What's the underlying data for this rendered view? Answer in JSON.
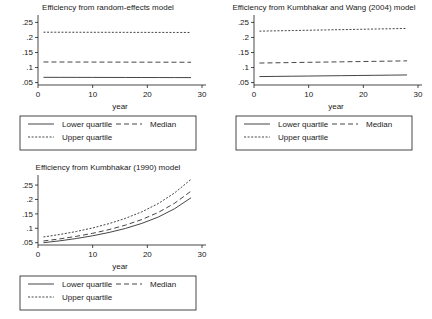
{
  "figure": {
    "background": "#ffffff",
    "line_color": "#303030",
    "axis_color": "#1a1a1a"
  },
  "legend": {
    "entries": [
      {
        "label": "Lower quartile",
        "style": "solid"
      },
      {
        "label": "Median",
        "style": "dashed"
      },
      {
        "label": "Upper quartile",
        "style": "dotted"
      }
    ]
  },
  "chart_data": [
    {
      "type": "line",
      "title": "Efficiency from random-effects model",
      "xlabel": "year",
      "ylabel": "",
      "xlim": [
        0,
        30
      ],
      "ylim": [
        0.042,
        0.268
      ],
      "xticks": [
        0,
        10,
        20,
        30
      ],
      "yticks": [
        0.05,
        0.1,
        0.15,
        0.2,
        0.25
      ],
      "ytick_labels": [
        ".05",
        ".1",
        ".15",
        ".2",
        ".25"
      ],
      "xtick_labels": [
        "0",
        "10",
        "20",
        "30"
      ],
      "grid": false,
      "legend_position": "below",
      "x": [
        1,
        4,
        7,
        10,
        13,
        16,
        19,
        22,
        25,
        28
      ],
      "series": [
        {
          "name": "Lower quartile",
          "style": "solid",
          "values": [
            0.0675,
            0.0674,
            0.0673,
            0.0672,
            0.0671,
            0.067,
            0.0669,
            0.0668,
            0.0667,
            0.0666
          ]
        },
        {
          "name": "Median",
          "style": "dashed",
          "values": [
            0.1185,
            0.1184,
            0.1183,
            0.1182,
            0.1181,
            0.118,
            0.1179,
            0.1178,
            0.1177,
            0.1176
          ]
        },
        {
          "name": "Upper quartile",
          "style": "dotted",
          "values": [
            0.2175,
            0.2174,
            0.2173,
            0.2172,
            0.2171,
            0.217,
            0.2169,
            0.2168,
            0.2167,
            0.2166
          ]
        }
      ]
    },
    {
      "type": "line",
      "title": "Efficiency from Kumbhakar and Wang (2004) model",
      "xlabel": "year",
      "ylabel": "",
      "xlim": [
        0,
        30
      ],
      "ylim": [
        0.042,
        0.268
      ],
      "xticks": [
        0,
        10,
        20,
        30
      ],
      "yticks": [
        0.05,
        0.1,
        0.15,
        0.2,
        0.25
      ],
      "ytick_labels": [
        ".05",
        ".1",
        ".15",
        ".2",
        ".25"
      ],
      "xtick_labels": [
        "0",
        "10",
        "20",
        "30"
      ],
      "grid": false,
      "legend_position": "below",
      "x": [
        1,
        4,
        7,
        10,
        13,
        16,
        19,
        22,
        25,
        28
      ],
      "series": [
        {
          "name": "Lower quartile",
          "style": "solid",
          "values": [
            0.07,
            0.0706,
            0.0712,
            0.0718,
            0.0724,
            0.073,
            0.0736,
            0.0742,
            0.0748,
            0.0754
          ]
        },
        {
          "name": "Median",
          "style": "dashed",
          "values": [
            0.115,
            0.1158,
            0.1166,
            0.1174,
            0.1182,
            0.119,
            0.1198,
            0.1206,
            0.1214,
            0.1222
          ]
        },
        {
          "name": "Upper quartile",
          "style": "dotted",
          "values": [
            0.221,
            0.222,
            0.223,
            0.224,
            0.225,
            0.226,
            0.227,
            0.228,
            0.229,
            0.23
          ]
        }
      ]
    },
    {
      "type": "line",
      "title": "Efficiency from Kumbhakar (1990) model",
      "xlabel": "year",
      "ylabel": "",
      "xlim": [
        0,
        30
      ],
      "ylim": [
        0.042,
        0.278
      ],
      "xticks": [
        0,
        10,
        20,
        30
      ],
      "yticks": [
        0.05,
        0.1,
        0.15,
        0.2,
        0.25
      ],
      "ytick_labels": [
        ".05",
        ".1",
        ".15",
        ".2",
        ".25"
      ],
      "xtick_labels": [
        "0",
        "10",
        "20",
        "30"
      ],
      "grid": false,
      "legend_position": "below",
      "x": [
        1,
        4,
        7,
        10,
        13,
        16,
        19,
        22,
        25,
        28
      ],
      "series": [
        {
          "name": "Lower quartile",
          "style": "solid",
          "values": [
            0.05,
            0.0565,
            0.0645,
            0.074,
            0.0855,
            0.0995,
            0.117,
            0.139,
            0.168,
            0.206
          ]
        },
        {
          "name": "Median",
          "style": "dashed",
          "values": [
            0.056,
            0.0632,
            0.072,
            0.0826,
            0.0954,
            0.111,
            0.1305,
            0.155,
            0.187,
            0.229
          ]
        },
        {
          "name": "Upper quartile",
          "style": "dotted",
          "values": [
            0.07,
            0.0785,
            0.0888,
            0.1012,
            0.1162,
            0.1345,
            0.1572,
            0.1858,
            0.223,
            0.27
          ]
        }
      ]
    }
  ]
}
